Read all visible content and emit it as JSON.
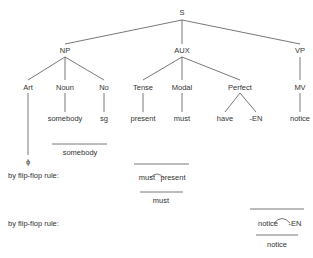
{
  "tree": {
    "root": "S",
    "np": {
      "label": "NP",
      "children": [
        "Art",
        "Noun",
        "No"
      ]
    },
    "aux": {
      "label": "AUX",
      "children": [
        "Tense",
        "Modal",
        "Perfect"
      ]
    },
    "vp": {
      "label": "VP",
      "children": [
        "MV"
      ]
    },
    "leaves": {
      "art": "ϕ",
      "noun": "somebody",
      "no": "sg",
      "tense": "present",
      "modal": "must",
      "perfect_left": "have",
      "perfect_right": "-EN",
      "mv": "notice"
    },
    "np_merged": "somebody"
  },
  "rules": [
    {
      "label": "by flip-flop rule:",
      "left": "must",
      "right": "present",
      "result": "must"
    },
    {
      "label": "by flip-flop rule:",
      "left": "notice",
      "right": "-EN",
      "result": "notice"
    }
  ]
}
